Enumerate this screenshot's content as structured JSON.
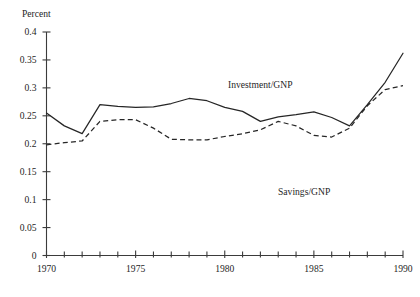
{
  "chart_data": {
    "type": "line",
    "title": "",
    "xlabel": "",
    "ylabel": "Percent",
    "xlim": [
      1970,
      1990
    ],
    "ylim": [
      0,
      0.4
    ],
    "grid": false,
    "legend_position": "inline-annotation",
    "y_ticks": [
      "0",
      "0.05",
      "0.1",
      "0.15",
      "0.2",
      "0.25",
      "0.3",
      "0.35",
      "0.4"
    ],
    "y_tick_values": [
      0,
      0.05,
      0.1,
      0.15,
      0.2,
      0.25,
      0.3,
      0.35,
      0.4
    ],
    "x_ticks": [
      "1970",
      "1975",
      "1980",
      "1985",
      "1990"
    ],
    "x_tick_values": [
      1970,
      1975,
      1980,
      1985,
      1990
    ],
    "x_minor_tick_values": [
      1971,
      1972,
      1973,
      1974,
      1976,
      1977,
      1978,
      1979,
      1981,
      1982,
      1983,
      1984,
      1986,
      1987,
      1988,
      1989
    ],
    "x": [
      1970,
      1971,
      1972,
      1973,
      1974,
      1975,
      1976,
      1977,
      1978,
      1979,
      1980,
      1981,
      1982,
      1983,
      1984,
      1985,
      1986,
      1987,
      1988,
      1989,
      1990
    ],
    "series": [
      {
        "name": "Investment/GNP",
        "style": "solid",
        "color": "#262626",
        "annotation": "Investment/GNP",
        "values": [
          0.255,
          0.232,
          0.218,
          0.27,
          0.267,
          0.265,
          0.266,
          0.272,
          0.281,
          0.277,
          0.265,
          0.258,
          0.24,
          0.248,
          0.252,
          0.257,
          0.247,
          0.232,
          0.27,
          0.31,
          0.362
        ]
      },
      {
        "name": "Savings/GNP",
        "style": "dashed",
        "color": "#262626",
        "annotation": "Savings/GNP",
        "values": [
          0.198,
          0.202,
          0.205,
          0.24,
          0.243,
          0.243,
          0.228,
          0.208,
          0.207,
          0.207,
          0.213,
          0.218,
          0.225,
          0.24,
          0.232,
          0.215,
          0.212,
          0.228,
          0.268,
          0.297,
          0.304
        ]
      }
    ]
  },
  "annotations": {
    "investment_label": "Investment/GNP",
    "savings_label": "Savings/GNP"
  },
  "axes": {
    "y_axis_title": "Percent"
  }
}
